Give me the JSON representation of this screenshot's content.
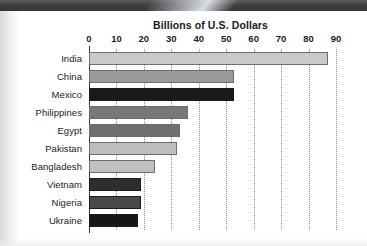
{
  "chart_data": {
    "type": "bar",
    "orientation": "horizontal",
    "title": "Billions of U.S. Dollars",
    "xlabel": "",
    "ylabel": "",
    "xlim": [
      0,
      90
    ],
    "xticks": [
      0,
      10,
      20,
      30,
      40,
      50,
      60,
      70,
      80,
      90
    ],
    "xtick_labels": [
      "0",
      "10",
      "20",
      "30",
      "40",
      "50",
      "60",
      "70",
      "80",
      "90"
    ],
    "grid": "vertical-dotted",
    "legend": "none",
    "categories": [
      "India",
      "China",
      "Mexico",
      "Philippines",
      "Egypt",
      "Pakistan",
      "Bangladesh",
      "Vietnam",
      "Nigeria",
      "Ukraine"
    ],
    "values": [
      87,
      53,
      53,
      36,
      33,
      32,
      24,
      19,
      19,
      18
    ],
    "bar_colors": [
      "#c9c9c9",
      "#9a9a9a",
      "#1a1a1a",
      "#787878",
      "#6f6f6f",
      "#bdbdbd",
      "#c0c0c0",
      "#2e2e2e",
      "#4a4a4a",
      "#161616"
    ]
  },
  "axis": {
    "tick_labels": [
      "0",
      "10",
      "20",
      "30",
      "40",
      "50",
      "60",
      "70",
      "80",
      "90"
    ]
  },
  "title": {
    "text": "Billions of U.S. Dollars"
  },
  "colors": {
    "axis": "#3a3a3a",
    "gridline": "#8d8d8d",
    "text": "#1b1b1b",
    "background": "#ffffff"
  }
}
